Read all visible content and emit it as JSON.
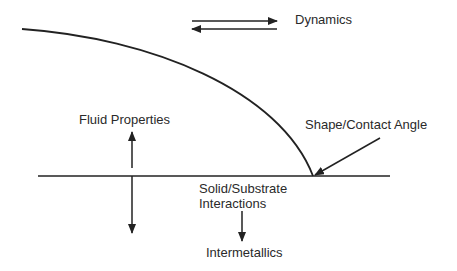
{
  "diagram": {
    "labels": {
      "dynamics": "Dynamics",
      "fluid_properties": "Fluid Properties",
      "shape_contact_angle": "Shape/Contact Angle",
      "solid_substrate_line1": "Solid/Substrate",
      "solid_substrate_line2": "Interactions",
      "intermetallics": "Intermetallics"
    },
    "colors": {
      "stroke": "#222222",
      "text": "#2a2a2a",
      "background": "#ffffff"
    }
  }
}
